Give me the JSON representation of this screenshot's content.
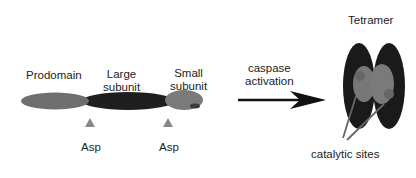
{
  "procaspase": {
    "prodomain_label": "Prodomain",
    "large_subunit_label_line1": "Large",
    "large_subunit_label_line2": "subunit",
    "small_subunit_label_line1": "Small",
    "small_subunit_label_line2": "subunit",
    "cleavage_site_1": "Asp",
    "cleavage_site_2": "Asp"
  },
  "transition": {
    "label_line1": "caspase",
    "label_line2": "activation"
  },
  "tetramer": {
    "title": "Tetramer",
    "catalytic_label": "catalytic sites"
  },
  "colors": {
    "prodomain": "#6e6e6e",
    "large_subunit": "#1e1e1e",
    "small_subunit": "#7a7a7a",
    "cleavage_marker": "#888888",
    "arrow": "#111111"
  }
}
